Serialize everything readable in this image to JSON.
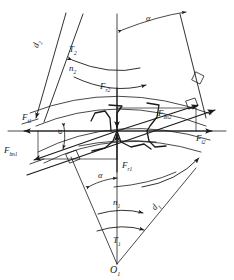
{
  "figure": {
    "background_color": "#ffffff",
    "line_color": "#1a1a1a",
    "labels": {
      "pitch_diameter_2": "d",
      "pitch_diameter_2_sub": "2",
      "pitch_diameter_1": "d",
      "pitch_diameter_1_sub": "1",
      "torque_2": "T",
      "torque_2_sub": "2",
      "speed_2": "n",
      "speed_2_sub": "2",
      "torque_1": "T",
      "torque_1_sub": "1",
      "speed_1": "n",
      "speed_1_sub": "1",
      "radial_force_2": "F",
      "radial_force_2_sub": "r2",
      "radial_force_1": "F",
      "radial_force_1_sub": "r1",
      "tangential_force_1": "F",
      "tangential_force_1_sub": "t1",
      "tangential_force_2": "F",
      "tangential_force_2_sub": "t2",
      "normal_force_1": "F",
      "normal_force_1_sub": "bn1",
      "normal_force_2": "F",
      "normal_force_2_sub": "bn2",
      "pressure_angle_top": "α",
      "pressure_angle_mid": "α",
      "pressure_angle_bottom": "α",
      "center_point": "O",
      "center_point_sub": "1"
    }
  }
}
